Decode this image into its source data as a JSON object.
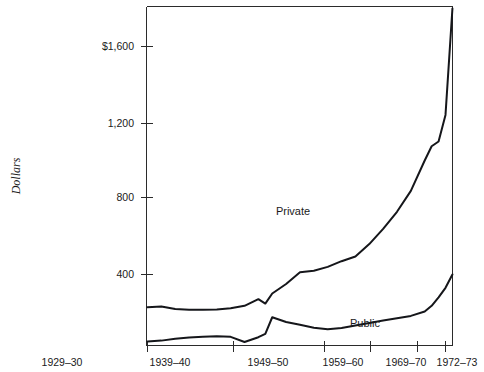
{
  "chart_data": {
    "type": "line",
    "title": "",
    "subtitle": "",
    "xlabel": "",
    "ylabel": "Dollars",
    "xlim": [
      1929,
      1973
    ],
    "ylim": [
      0,
      1800
    ],
    "grid": false,
    "legend_position": "inline-annotations",
    "y_ticks": [
      "$1,600",
      "1,200",
      "800",
      "400"
    ],
    "y_tick_values": [
      1600,
      1200,
      800,
      400
    ],
    "x_ticks": [
      "1929–30",
      "1939–40",
      "1949–50",
      "1959–60",
      "1969–70",
      "1972–73"
    ],
    "x_tick_values": [
      1929,
      1939,
      1949,
      1959,
      1969,
      1972
    ],
    "annotations": [
      {
        "name": "private-label",
        "text": "Private",
        "x": 1952,
        "y": 690
      },
      {
        "name": "public-label",
        "text": "Public",
        "x": 1964,
        "y": 175
      }
    ],
    "series": [
      {
        "name": "Private",
        "color": "#15161a",
        "x": [
          1929,
          1931,
          1933,
          1935,
          1937,
          1939,
          1941,
          1943,
          1945,
          1946,
          1947,
          1949,
          1951,
          1953,
          1955,
          1957,
          1959,
          1961,
          1963,
          1965,
          1967,
          1969,
          1970,
          1971,
          1972,
          1973
        ],
        "values": [
          228,
          232,
          218,
          215,
          215,
          216,
          222,
          235,
          270,
          247,
          300,
          350,
          412,
          420,
          440,
          470,
          495,
          560,
          640,
          730,
          840,
          1000,
          1075,
          1100,
          1240,
          1800
        ]
      },
      {
        "name": "Public",
        "color": "#15161a",
        "x": [
          1929,
          1931,
          1933,
          1935,
          1937,
          1939,
          1941,
          1943,
          1945,
          1946,
          1947,
          1949,
          1951,
          1953,
          1955,
          1957,
          1959,
          1961,
          1963,
          1965,
          1967,
          1969,
          1970,
          1971,
          1972,
          1973
        ],
        "values": [
          48,
          52,
          62,
          68,
          72,
          75,
          72,
          45,
          70,
          88,
          175,
          150,
          135,
          120,
          112,
          118,
          132,
          145,
          158,
          170,
          182,
          205,
          235,
          280,
          330,
          400
        ]
      }
    ]
  },
  "axis": {
    "y_title": "Dollars"
  }
}
